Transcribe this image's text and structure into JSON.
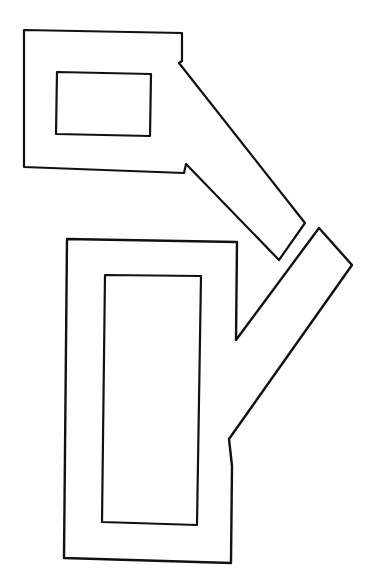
{
  "figure": {
    "line_color": "#111111",
    "background_color": "#ffffff",
    "shapes": [
      {
        "name": "upper-frame",
        "inner_window": "landscape rectangle",
        "arm_direction": "down-right"
      },
      {
        "name": "lower-frame",
        "inner_window": "portrait rectangle",
        "arm_direction": "up-right"
      }
    ]
  }
}
